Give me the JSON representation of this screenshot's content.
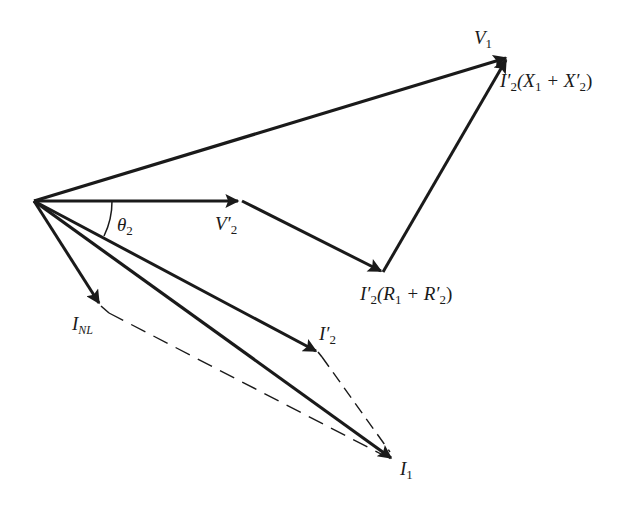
{
  "diagram": {
    "type": "phasor-diagram",
    "stroke_color": "#1a1a1a",
    "background": "#ffffff",
    "origin": [
      34,
      201
    ],
    "phasors": [
      {
        "id": "V1",
        "from": [
          34,
          201
        ],
        "to": [
          508,
          58
        ]
      },
      {
        "id": "V2prime",
        "from": [
          34,
          201
        ],
        "to": [
          240,
          201
        ]
      },
      {
        "id": "R_drop",
        "from": [
          242,
          201
        ],
        "to": [
          383,
          272
        ]
      },
      {
        "id": "X_drop",
        "from": [
          383,
          272
        ],
        "to": [
          508,
          58
        ]
      },
      {
        "id": "INL",
        "from": [
          34,
          201
        ],
        "to": [
          100,
          305
        ]
      },
      {
        "id": "I2prime",
        "from": [
          34,
          201
        ],
        "to": [
          318,
          352
        ]
      },
      {
        "id": "I1",
        "from": [
          34,
          201
        ],
        "to": [
          393,
          460
        ]
      }
    ],
    "dashed": [
      {
        "from": [
          102,
          307
        ],
        "to": [
          387,
          458
        ]
      },
      {
        "from": [
          320,
          355
        ],
        "to": [
          391,
          455
        ]
      }
    ],
    "labels": {
      "V1": {
        "base": "V",
        "sub": "1"
      },
      "X_drop": {
        "pre": "I′",
        "sub1": "2",
        "mid": "(X",
        "sub2": "1",
        "op": " + X′",
        "sub3": "2",
        "post": ")"
      },
      "V2prime": {
        "base": "V′",
        "sub": "2"
      },
      "theta": {
        "base": "θ",
        "sub": "2"
      },
      "R_drop": {
        "pre": "I′",
        "sub1": "2",
        "mid": "(R",
        "sub2": "1",
        "op": " + R′",
        "sub3": "2",
        "post": ")"
      },
      "INL": {
        "base": "I",
        "sub": "NL"
      },
      "I2prime": {
        "base": "I′",
        "sub": "2"
      },
      "I1": {
        "base": "I",
        "sub": "1"
      }
    }
  }
}
